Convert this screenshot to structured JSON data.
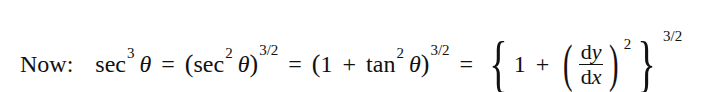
{
  "equation": {
    "label": "Now:",
    "terms": {
      "sec": "sec",
      "tan": "tan",
      "theta": "θ",
      "exp3": "3",
      "exp2": "2",
      "exp32": "3/2",
      "one": "1",
      "plus": "+",
      "equals": "=",
      "lparen": "(",
      "rparen": ")",
      "lbrace": "{",
      "rbrace": "}",
      "dy": "dy",
      "dx": "dx"
    },
    "latex": "\\sec^3\\theta = (\\sec^2\\theta)^{3/2} = (1+\\tan^2\\theta)^{3/2} = \\left\\{1+\\left(\\frac{dy}{dx}\\right)^2\\right\\}^{3/2}"
  }
}
